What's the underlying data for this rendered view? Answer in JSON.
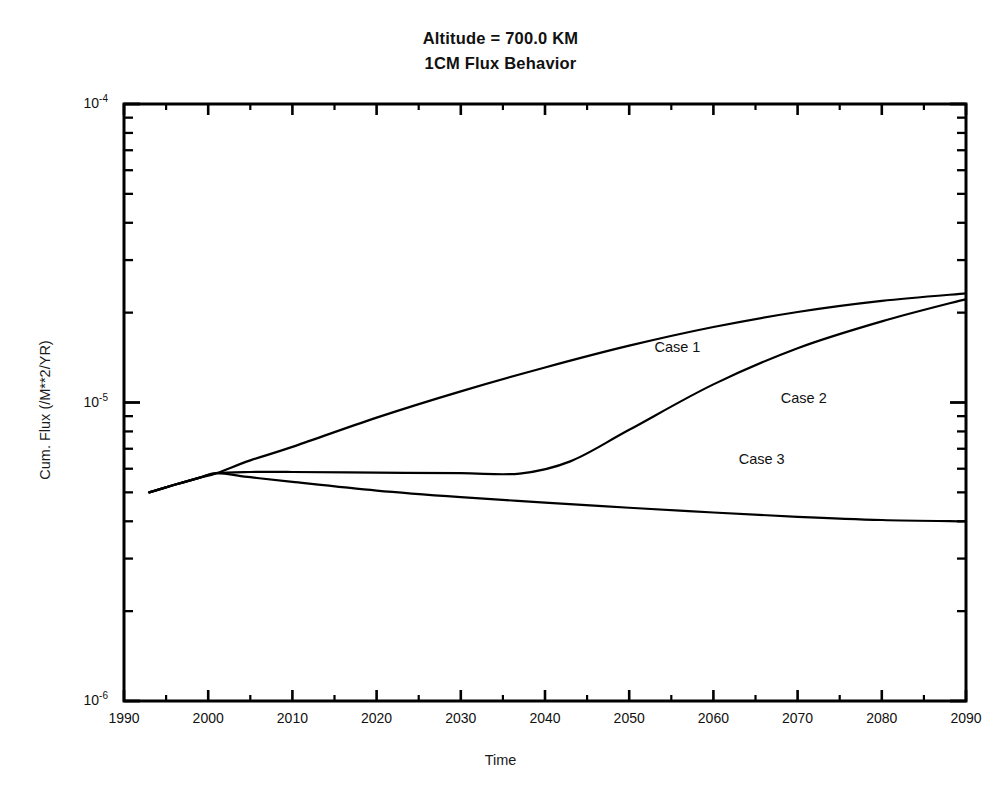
{
  "figure": {
    "title_lines": [
      "Altitude = 700.0 KM",
      "1CM Flux Behavior"
    ],
    "xlabel": "Time",
    "ylabel": "Cum. Flux (/M**2/YR)"
  },
  "chart_data": {
    "type": "line",
    "subtitle": "1CM Flux Behavior",
    "xlabel": "Time",
    "ylabel": "Cum. Flux (/M**2/YR)",
    "xscale": "linear",
    "yscale": "log",
    "xlim": [
      1990,
      2090
    ],
    "ylim": [
      1e-06,
      0.0001
    ],
    "grid": false,
    "legend_position": "inline-annotations",
    "xticks": [
      1990,
      2000,
      2010,
      2020,
      2030,
      2040,
      2050,
      2060,
      2070,
      2080,
      2090
    ],
    "xtick_labels": [
      "1990",
      "2000",
      "2010",
      "2020",
      "2030",
      "2040",
      "2050",
      "2060",
      "2070",
      "2080",
      "2090"
    ],
    "x_minor_tick_interval": 5,
    "yticks": [
      1e-06,
      1e-05,
      0.0001
    ],
    "ytick_labels": [
      "10-6",
      "10-5",
      "10-4"
    ],
    "ytick_mantissa": [
      "10",
      "10",
      "10"
    ],
    "ytick_exponents": [
      "-6",
      "-5",
      "-4"
    ],
    "y_minor_ticks": "decade subdivisions 2-9",
    "series": [
      {
        "name": "Case 1",
        "label": "Case 1",
        "color": "#000000",
        "annotation_x": 2053,
        "annotation_y": 1.52e-05,
        "x": [
          1993,
          1996,
          1999,
          2001,
          2005,
          2010,
          2020,
          2030,
          2040,
          2050,
          2060,
          2070,
          2080,
          2090
        ],
        "y": [
          5e-06,
          5.3e-06,
          5.6e-06,
          5.8e-06,
          6.4e-06,
          7.1e-06,
          8.9e-06,
          1.09e-05,
          1.31e-05,
          1.55e-05,
          1.79e-05,
          2.01e-05,
          2.19e-05,
          2.32e-05
        ]
      },
      {
        "name": "Case 2",
        "label": "Case 2",
        "color": "#000000",
        "annotation_x": 2068,
        "annotation_y": 1.03e-05,
        "x": [
          1993,
          1996,
          1999,
          2001,
          2005,
          2010,
          2020,
          2030,
          2037,
          2043,
          2050,
          2060,
          2070,
          2080,
          2090
        ],
        "y": [
          5e-06,
          5.3e-06,
          5.6e-06,
          5.8e-06,
          5.85e-06,
          5.85e-06,
          5.82e-06,
          5.8e-06,
          5.78e-06,
          6.35e-06,
          8.1e-06,
          1.15e-05,
          1.52e-05,
          1.87e-05,
          2.22e-05
        ]
      },
      {
        "name": "Case 3",
        "label": "Case 3",
        "color": "#000000",
        "annotation_x": 2063,
        "annotation_y": 6.4e-06,
        "x": [
          1993,
          1996,
          1999,
          2001,
          2005,
          2010,
          2020,
          2030,
          2040,
          2050,
          2060,
          2070,
          2080,
          2090
        ],
        "y": [
          5e-06,
          5.3e-06,
          5.6e-06,
          5.8e-06,
          5.62e-06,
          5.42e-06,
          5.07e-06,
          4.82e-06,
          4.62e-06,
          4.44e-06,
          4.28e-06,
          4.14e-06,
          4.04e-06,
          4e-06
        ]
      }
    ]
  }
}
